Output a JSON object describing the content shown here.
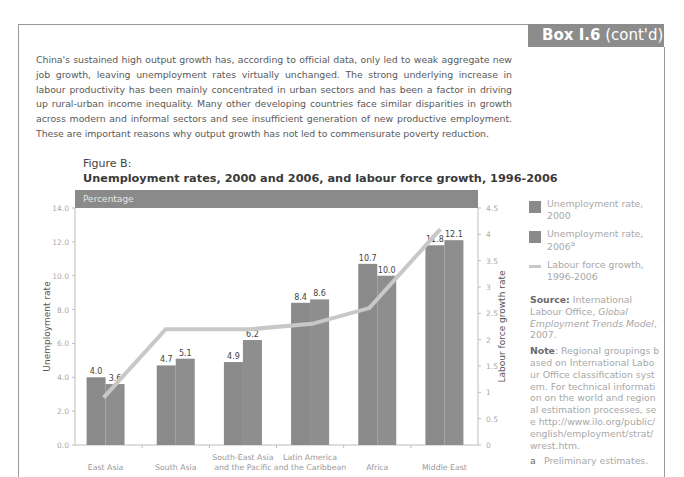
{
  "box": {
    "tab_bold": "Box I.6",
    "tab_rest": " (cont'd)"
  },
  "intro_text": "China's sustained high output growth has, according to official data, only led to weak aggregate new job growth, leaving unemployment rates virtually unchanged. The strong underlying increase in labour productivity has been mainly concentrated in urban sectors and has been a factor in driving up rural-urban income inequality. Many other developing countries face similar disparities in growth across modern and informal sectors and see insufficient generation of new productive employment. These are important reasons why output growth has not led to commensurate poverty reduction.",
  "figure": {
    "label": "Figure B:",
    "title": "Unemployment rates, 2000 and 2006, and labour force growth, 1996-2006",
    "unit_band": "Percentage"
  },
  "legend": {
    "items": [
      {
        "label": "Unemployment rate, 2000",
        "sup": ""
      },
      {
        "label": "Unemployment rate, 2006",
        "sup": "a"
      },
      {
        "label": "Labour force growth, 1996-2006",
        "sup": ""
      }
    ]
  },
  "notes": {
    "source_label": "Source:",
    "source_text_1": " International Labour Office, ",
    "source_italic": "Global Employment Trends Model",
    "source_text_2": ", 2007.",
    "note_label": "Note",
    "note_text": ": Regional groupings based on International Labour Office classification system. For technical information on the world and regional estimation processes, see http://www.ilo.org/public/english/employment/strat/wrest.htm.",
    "footnote_marker": "a",
    "footnote_text": "Preliminary estimates."
  },
  "colors": {
    "bar_2000": "#8a8a8a",
    "bar_2006": "#8e8e8e",
    "line": "#c8c8c8",
    "header_band": "#8a8a8a"
  },
  "chart_data": {
    "type": "bar",
    "title": "Unemployment rates, 2000 and 2006, and labour force growth, 1996-2006",
    "subtitle": "Percentage",
    "categories": [
      "East Asia",
      "South Asia",
      "South-East Asia and the Pacific",
      "Latin America and the Caribbean",
      "Africa",
      "Middle East"
    ],
    "category_labels": [
      [
        "East Asia"
      ],
      [
        "South Asia"
      ],
      [
        "South-East  Asia",
        "and the Pacific"
      ],
      [
        "Latin America",
        "and the Caribbean"
      ],
      [
        "Africa"
      ],
      [
        "Middle East"
      ]
    ],
    "series": [
      {
        "name": "Unemployment rate, 2000",
        "type": "bar",
        "axis": "left",
        "values": [
          4.0,
          4.7,
          4.9,
          8.4,
          10.7,
          11.8
        ]
      },
      {
        "name": "Unemployment rate, 2006",
        "type": "bar",
        "axis": "left",
        "values": [
          3.6,
          5.1,
          6.2,
          8.6,
          10.0,
          12.1
        ]
      },
      {
        "name": "Labour force growth, 1996-2006",
        "type": "line",
        "axis": "right",
        "values": [
          0.9,
          2.2,
          2.2,
          2.3,
          2.6,
          4.1
        ]
      }
    ],
    "xlabel": "",
    "ylabel": "Unemployment rate",
    "ylabel_right": "Labour force growth rate",
    "ylim": [
      0,
      14
    ],
    "ylim_right": [
      0,
      4.5
    ],
    "yticks": [
      "0.0",
      "2.0",
      "4.0",
      "6.0",
      "8.0",
      "10.0",
      "12.0",
      "14.0"
    ],
    "yticks_right": [
      "0",
      "0.5",
      "1",
      "1.5",
      "2",
      "2.5",
      "3",
      "3.5",
      "4",
      "4.5"
    ],
    "grid": false,
    "legend_position": "right"
  }
}
